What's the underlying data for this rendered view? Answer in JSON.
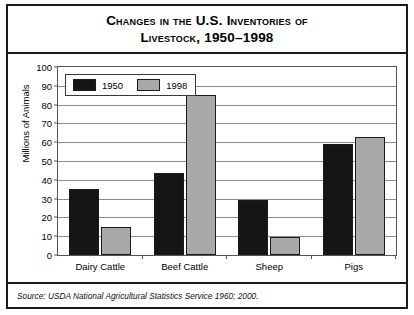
{
  "figure": {
    "title_lines": [
      "Changes in the U.S. Inventories of",
      "Livestock, 1950–1998"
    ],
    "source_label": "Source:",
    "source_text": " USDA National Agricultural Statistics Service 1960; 2000.",
    "colors": {
      "series_1950": "#151515",
      "series_1998": "#a9a9a9",
      "frame": "#1b1b1b",
      "gridline": "#8d8d8d",
      "axis": "#555555",
      "background": "#ffffff"
    }
  },
  "chart_data": {
    "type": "bar",
    "title": "Changes in the U.S. Inventories of Livestock, 1950–1998",
    "categories": [
      "Dairy Cattle",
      "Beef Cattle",
      "Sheep",
      "Pigs"
    ],
    "series": [
      {
        "name": "1950",
        "values": [
          35,
          43.5,
          29,
          59
        ]
      },
      {
        "name": "1998",
        "values": [
          15,
          85,
          9.5,
          63
        ]
      }
    ],
    "xlabel": "",
    "ylabel": "Millions of Animals",
    "ylim": [
      0,
      100
    ],
    "yticks": [
      0,
      10,
      20,
      30,
      40,
      50,
      60,
      70,
      80,
      90,
      100
    ],
    "ytick_labels": [
      "0",
      "10",
      "20",
      "30",
      "40",
      "50",
      "60",
      "70",
      "80",
      "90",
      "100"
    ],
    "grid": true,
    "legend_position": "upper left",
    "source": "Source: USDA National Agricultural Statistics Service 1960; 2000."
  }
}
